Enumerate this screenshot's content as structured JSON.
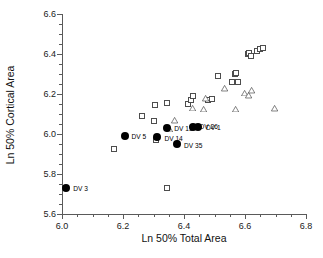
{
  "chart_data": {
    "type": "scatter",
    "title": "",
    "xlabel": "Ln 50% Total Area",
    "ylabel": "Ln 50% Cortical Area",
    "xlim": [
      6.0,
      6.8
    ],
    "ylim": [
      5.6,
      6.6
    ],
    "xticks": [
      "6.0",
      "6.2",
      "6.4",
      "6.6",
      "6.8"
    ],
    "yticks": [
      "5.6",
      "5.8",
      "6.0",
      "6.2",
      "6.4",
      "6.6"
    ],
    "xtick_values": [
      6.0,
      6.2,
      6.4,
      6.6,
      6.8
    ],
    "ytick_values": [
      5.6,
      5.8,
      6.0,
      6.2,
      6.4,
      6.6
    ],
    "xminor_step": 0.05,
    "yminor_step": 0.05,
    "grid": false,
    "legend": "none",
    "series": [
      {
        "name": "open-square",
        "marker": "square",
        "points": [
          {
            "x": 6.169,
            "y": 5.925
          },
          {
            "x": 6.262,
            "y": 6.09
          },
          {
            "x": 6.305,
            "y": 6.145
          },
          {
            "x": 6.3,
            "y": 6.063
          },
          {
            "x": 6.345,
            "y": 6.153
          },
          {
            "x": 6.308,
            "y": 5.97
          },
          {
            "x": 6.343,
            "y": 5.728
          },
          {
            "x": 6.412,
            "y": 6.152
          },
          {
            "x": 6.424,
            "y": 6.172
          },
          {
            "x": 6.43,
            "y": 6.19
          },
          {
            "x": 6.478,
            "y": 6.172
          },
          {
            "x": 6.492,
            "y": 6.173
          },
          {
            "x": 6.51,
            "y": 6.29
          },
          {
            "x": 6.556,
            "y": 6.258
          },
          {
            "x": 6.566,
            "y": 6.3
          },
          {
            "x": 6.572,
            "y": 6.307
          },
          {
            "x": 6.578,
            "y": 6.262
          },
          {
            "x": 6.61,
            "y": 6.398
          },
          {
            "x": 6.614,
            "y": 6.405
          },
          {
            "x": 6.62,
            "y": 6.392
          },
          {
            "x": 6.64,
            "y": 6.413
          },
          {
            "x": 6.65,
            "y": 6.425
          },
          {
            "x": 6.658,
            "y": 6.428
          }
        ]
      },
      {
        "name": "open-triangle",
        "marker": "triangle",
        "points": [
          {
            "x": 6.352,
            "y": 6.025
          },
          {
            "x": 6.37,
            "y": 6.097
          },
          {
            "x": 6.428,
            "y": 6.19
          },
          {
            "x": 6.465,
            "y": 6.215
          },
          {
            "x": 6.47,
            "y": 6.297
          },
          {
            "x": 6.532,
            "y": 6.378
          },
          {
            "x": 6.57,
            "y": 6.305
          },
          {
            "x": 6.6,
            "y": 6.415
          },
          {
            "x": 6.612,
            "y": 6.432
          },
          {
            "x": 6.622,
            "y": 6.487
          },
          {
            "x": 6.698,
            "y": 6.427
          }
        ]
      },
      {
        "name": "filled-circle-labeled",
        "marker": "circle",
        "points": [
          {
            "x": 6.014,
            "y": 5.728,
            "label": "DV 3"
          },
          {
            "x": 6.205,
            "y": 5.992,
            "label": "DV 5"
          },
          {
            "x": 6.313,
            "y": 5.983,
            "label": "DV 14"
          },
          {
            "x": 6.345,
            "y": 6.028,
            "label": "DV 13"
          },
          {
            "x": 6.377,
            "y": 5.948,
            "label": "DV 35"
          },
          {
            "x": 6.428,
            "y": 6.035,
            "label": "DV 26"
          },
          {
            "x": 6.446,
            "y": 6.035,
            "label": "DV 1"
          }
        ]
      }
    ]
  }
}
